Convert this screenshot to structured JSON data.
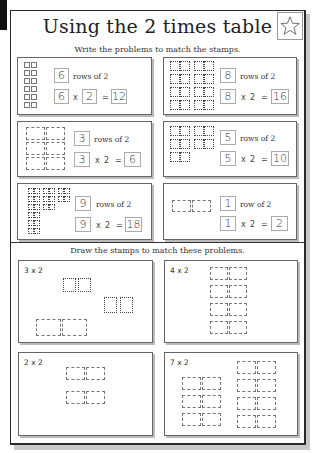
{
  "title": "Using the 2 times table",
  "section1": {
    "instruction": "Write the problems to match the stamps.",
    "problems": [
      {
        "rows": "6",
        "rows_text": "rows of 2",
        "a": "6",
        "times": "x",
        "b": "2",
        "eq": "=",
        "answer": "12"
      },
      {
        "rows": "8",
        "rows_text": "rows of 2",
        "a": "8",
        "times": "x",
        "b": "2",
        "eq": "=",
        "answer": "16"
      },
      {
        "rows": "3",
        "rows_text": "rows of 2",
        "a": "3",
        "times": "x",
        "b": "2",
        "eq": "=",
        "answer": "6"
      },
      {
        "rows": "5",
        "rows_text": "rows of 2",
        "a": "5",
        "times": "x",
        "b": "2",
        "eq": "=",
        "answer": "10"
      },
      {
        "rows": "9",
        "rows_text": "rows of 2",
        "a": "9",
        "times": "x",
        "b": "2",
        "eq": "=",
        "answer": "18"
      },
      {
        "rows": "1",
        "rows_text": "row of 2",
        "a": "1",
        "times": "x",
        "b": "2",
        "eq": "=",
        "answer": "2"
      }
    ]
  },
  "section2": {
    "instruction": "Draw the stamps to match these problems.",
    "problems": [
      {
        "label": "3 x 2"
      },
      {
        "label": "4 x 2"
      },
      {
        "label": "2 x 2"
      },
      {
        "label": "7 x 2"
      }
    ]
  },
  "icons": {
    "star": "star-icon"
  }
}
